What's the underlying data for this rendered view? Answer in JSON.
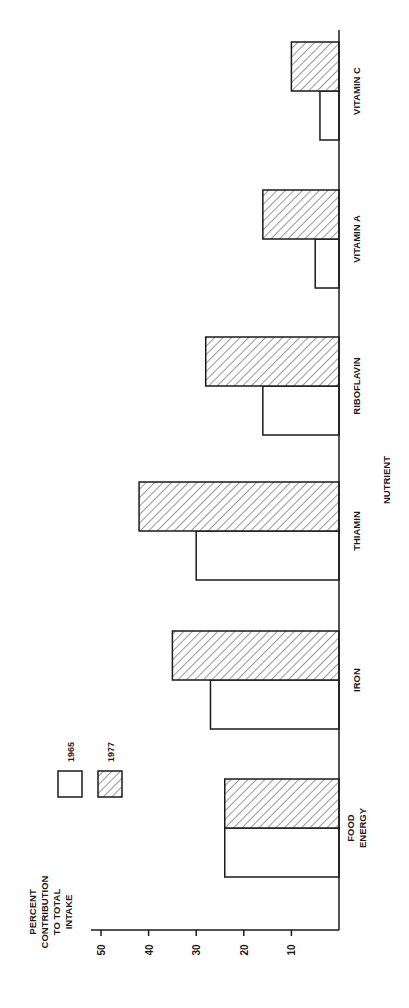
{
  "chart_data": {
    "type": "bar",
    "orientation": "rotated-90-ccw",
    "title": "",
    "xlabel": "NUTRIENT",
    "ylabel": [
      "PERCENT",
      "CONTRIBUTION",
      "TO TOTAL",
      "INTAKE"
    ],
    "ylim": [
      0,
      50
    ],
    "yticks": [
      10,
      20,
      30,
      40,
      50
    ],
    "grid": false,
    "legend_position": "upper-left",
    "categories": [
      "FOOD ENERGY",
      "IRON",
      "THIAMIN",
      "RIBOFLAVIN",
      "VITAMIN A",
      "VITAMIN C"
    ],
    "category_lines": [
      [
        "FOOD",
        "ENERGY"
      ],
      [
        "IRON"
      ],
      [
        "THIAMIN"
      ],
      [
        "RIBOFLAVIN"
      ],
      [
        "VITAMIN A"
      ],
      [
        "VITAMIN C"
      ]
    ],
    "series": [
      {
        "name": "1965",
        "fill": "open",
        "values": [
          24,
          27,
          30,
          16,
          5,
          4
        ]
      },
      {
        "name": "1977",
        "fill": "hatched",
        "values": [
          24,
          35,
          42,
          28,
          16,
          10
        ]
      }
    ]
  },
  "legend": {
    "items": [
      {
        "label": "1965",
        "style": "open"
      },
      {
        "label": "1977",
        "style": "hatched"
      }
    ]
  },
  "colors": {
    "ink": "#1a1a1a",
    "background": "#ffffff"
  }
}
